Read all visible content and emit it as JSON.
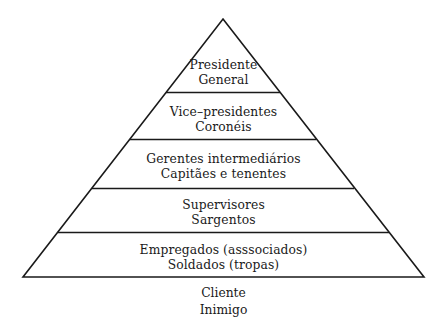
{
  "diagram": {
    "type": "pyramid",
    "kind": "organizational-hierarchy",
    "orientation": "apex-up",
    "background_color": "#ffffff",
    "stroke_color": "#1a1a1a",
    "text_color": "#1a1a1a",
    "apex": {
      "x": 223,
      "y": 19
    },
    "base_left": {
      "x": 23,
      "y": 277
    },
    "base_right": {
      "x": 424,
      "y": 277
    },
    "divider_y": [
      92,
      139,
      188,
      232
    ],
    "tiers": [
      {
        "index": 0,
        "name": "tier-presidente-general",
        "line1": "Presidente",
        "line2": "General"
      },
      {
        "index": 1,
        "name": "tier-vice-presidentes-coroneis",
        "line1": "Vice–presidentes",
        "line2": "Coronéis"
      },
      {
        "index": 2,
        "name": "tier-gerentes-capitaes",
        "line1": "Gerentes intermediários",
        "line2": "Capitães e tenentes"
      },
      {
        "index": 3,
        "name": "tier-supervisores-sargentos",
        "line1": "Supervisores",
        "line2": "Sargentos"
      },
      {
        "index": 4,
        "name": "tier-empregados-soldados",
        "line1": "Empregados (asssociados)",
        "line2": "Soldados (tropas)"
      }
    ],
    "caption": {
      "line1": "Cliente",
      "line2": "Inimigo"
    }
  }
}
